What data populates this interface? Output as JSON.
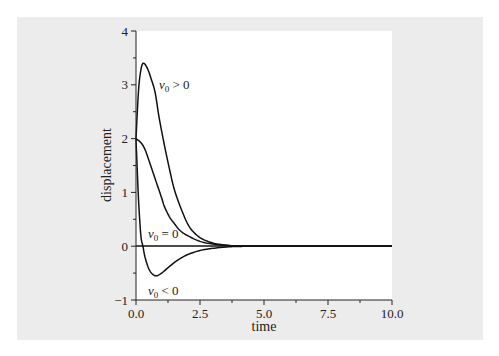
{
  "chart_data": {
    "type": "line",
    "title": "",
    "xlabel": "time",
    "ylabel": "displacement",
    "xlim": [
      0,
      10
    ],
    "ylim": [
      -1,
      4
    ],
    "x_ticks": [
      "0.0",
      "2.5",
      "5.0",
      "7.5",
      "10.0"
    ],
    "y_ticks": [
      "−1",
      "0",
      "1",
      "2",
      "3",
      "4"
    ],
    "grid": false,
    "legend": "inline labels on curves",
    "series": [
      {
        "name": "v0 > 0",
        "label_main": "v",
        "label_sub": "0",
        "label_rel": " > 0",
        "x": [
          0,
          0.1,
          0.2,
          0.3,
          0.45,
          0.6,
          0.75,
          0.9,
          1.1,
          1.3,
          1.5,
          1.8,
          2.1,
          2.5,
          3.0,
          3.5,
          4.0,
          5.0,
          10.0
        ],
        "y": [
          2,
          2.9,
          3.3,
          3.4,
          3.3,
          3.1,
          2.85,
          2.4,
          1.9,
          1.45,
          1.05,
          0.65,
          0.35,
          0.16,
          0.06,
          0.02,
          0.005,
          0,
          0
        ]
      },
      {
        "name": "v0 = 0",
        "label_main": "v",
        "label_sub": "0",
        "label_rel": " = 0",
        "x": [
          0,
          0.2,
          0.35,
          0.5,
          0.75,
          1.0,
          1.1,
          1.3,
          1.5,
          1.7,
          2.0,
          2.5,
          3.0,
          3.5,
          4.0,
          5.0,
          10.0
        ],
        "y": [
          2,
          1.92,
          1.8,
          1.6,
          1.25,
          0.9,
          0.75,
          0.55,
          0.42,
          0.3,
          0.2,
          0.09,
          0.04,
          0.015,
          0.005,
          0,
          0
        ]
      },
      {
        "name": "v0 < 0",
        "label_main": "v",
        "label_sub": "0",
        "label_rel": " < 0",
        "x": [
          0,
          0.05,
          0.1,
          0.15,
          0.2,
          0.27,
          0.35,
          0.5,
          0.65,
          0.8,
          1.0,
          1.3,
          1.6,
          2.0,
          2.5,
          3.0,
          3.5,
          4.0,
          5.0,
          10.0
        ],
        "y": [
          2,
          1.4,
          0.85,
          0.45,
          0.15,
          0,
          -0.2,
          -0.42,
          -0.52,
          -0.55,
          -0.5,
          -0.38,
          -0.27,
          -0.16,
          -0.08,
          -0.04,
          -0.015,
          -0.005,
          0,
          0
        ]
      }
    ],
    "zero_line": true
  }
}
